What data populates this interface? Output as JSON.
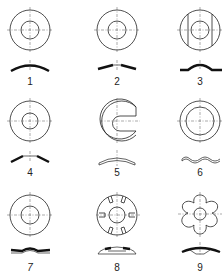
{
  "figure": {
    "type": "washer-types-diagram",
    "items": [
      {
        "id": 1,
        "label": "1",
        "kind": "curved spring washer",
        "cx": 30,
        "cy": 30,
        "ry": 68,
        "ly": 82
      },
      {
        "id": 2,
        "label": "2",
        "kind": "conical washer, shallow",
        "cx": 117,
        "cy": 30,
        "ry": 68,
        "ly": 82
      },
      {
        "id": 3,
        "label": "3",
        "kind": "curved washer with flats",
        "cx": 200,
        "cy": 30,
        "ry": 68,
        "ly": 82
      },
      {
        "id": 4,
        "label": "4",
        "kind": "conical (Belleville) washer",
        "cx": 30,
        "cy": 121,
        "ry": 160,
        "ly": 173
      },
      {
        "id": 5,
        "label": "5",
        "kind": "slotted curved washer (C-shape)",
        "cx": 117,
        "cy": 121,
        "ry": 160,
        "ly": 173
      },
      {
        "id": 6,
        "label": "6",
        "kind": "wave washer",
        "cx": 200,
        "cy": 121,
        "ry": 160,
        "ly": 173
      },
      {
        "id": 7,
        "label": "7",
        "kind": "wave washer, flat",
        "cx": 30,
        "cy": 215,
        "ry": 251,
        "ly": 268
      },
      {
        "id": 8,
        "label": "8",
        "kind": "slotted conical washer",
        "cx": 117,
        "cy": 215,
        "ry": 251,
        "ly": 268
      },
      {
        "id": 9,
        "label": "9",
        "kind": "lobed (star) spring washer",
        "cx": 200,
        "cy": 215,
        "ry": 251,
        "ly": 268
      }
    ]
  },
  "colors": {
    "stroke": "#222222",
    "thin": "#444444",
    "background": "#ffffff"
  }
}
